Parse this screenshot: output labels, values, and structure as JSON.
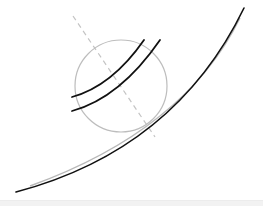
{
  "diagram": {
    "type": "sketch",
    "colors": {
      "background": "#ffffff",
      "ink": "#111111",
      "guide": "#b8b8b8",
      "circle": "#bdbdbd",
      "axis": "#c4c4c4",
      "footer": "#f2f2f2"
    },
    "circle": {
      "cx": 121,
      "cy": 86,
      "r": 46
    },
    "axis_line": {
      "x1": 73,
      "y1": 16,
      "x2": 155,
      "y2": 137,
      "dash": "5,4"
    },
    "arcs": [
      {
        "d": "M72,97 Q112,86 144,40"
      },
      {
        "d": "M72,111 Q120,98 160,40"
      }
    ],
    "sweep_curve": {
      "d": "M16,192 Q175,150 244,8"
    },
    "guide_curve": {
      "d": "M30,186 Q185,130 240,18"
    }
  }
}
